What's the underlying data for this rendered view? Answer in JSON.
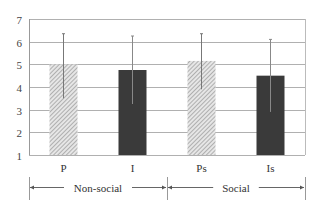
{
  "chart_data": {
    "type": "bar",
    "title": "",
    "xlabel": "",
    "ylabel": "",
    "ylim": [
      1,
      7
    ],
    "yticks": [
      1,
      2,
      3,
      4,
      5,
      6,
      7
    ],
    "grid": true,
    "categories": [
      "P",
      "I",
      "Ps",
      "Is"
    ],
    "values": [
      5.0,
      4.75,
      5.15,
      4.5
    ],
    "error_upper": [
      6.35,
      6.25,
      6.35,
      6.1
    ],
    "error_lower": [
      3.5,
      3.25,
      3.9,
      2.9
    ],
    "fills": [
      "hatched",
      "dark",
      "hatched",
      "dark"
    ],
    "groups": [
      {
        "label": "Non-social",
        "categories": [
          "P",
          "I"
        ]
      },
      {
        "label": "Social",
        "categories": [
          "Ps",
          "Is"
        ]
      }
    ],
    "colors": {
      "dark": "#3a3a3a",
      "hatch": "#9a9a9a",
      "grid": "#b0b0b0"
    }
  }
}
